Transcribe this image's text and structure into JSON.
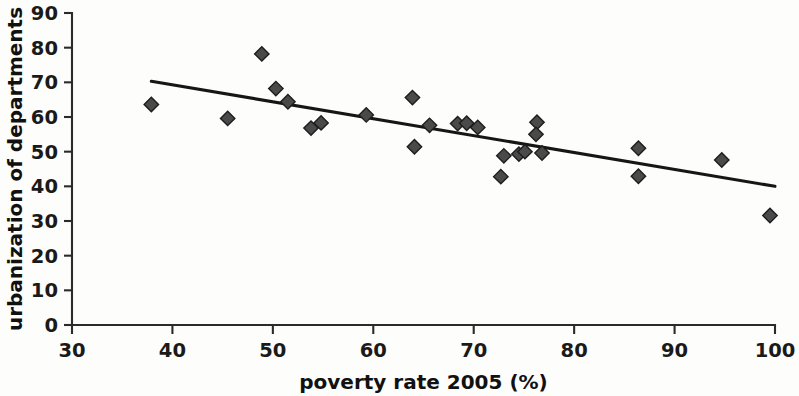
{
  "chart_data": {
    "type": "scatter",
    "title": "",
    "xlabel": "poverty rate 2005 (%)",
    "ylabel": "urbanization of departments",
    "xlim": [
      30,
      100
    ],
    "ylim": [
      0,
      90
    ],
    "xticks": [
      30,
      40,
      50,
      60,
      70,
      80,
      90,
      100
    ],
    "yticks": [
      0,
      10,
      20,
      30,
      40,
      50,
      60,
      70,
      80,
      90
    ],
    "xtick_labels": [
      "30",
      "40",
      "50",
      "60",
      "70",
      "80",
      "90",
      "100"
    ],
    "ytick_labels": [
      "0",
      "10",
      "20",
      "30",
      "40",
      "50",
      "60",
      "70",
      "80",
      "90"
    ],
    "grid": false,
    "legend": null,
    "marker": "diamond",
    "points": [
      {
        "x": 37.9,
        "y": 63.6
      },
      {
        "x": 45.5,
        "y": 59.6
      },
      {
        "x": 48.9,
        "y": 78.2
      },
      {
        "x": 50.3,
        "y": 68.2
      },
      {
        "x": 51.5,
        "y": 64.4
      },
      {
        "x": 53.8,
        "y": 56.8
      },
      {
        "x": 54.8,
        "y": 58.3
      },
      {
        "x": 59.3,
        "y": 60.6
      },
      {
        "x": 63.9,
        "y": 65.6
      },
      {
        "x": 64.1,
        "y": 51.4
      },
      {
        "x": 65.6,
        "y": 57.6
      },
      {
        "x": 68.4,
        "y": 58.1
      },
      {
        "x": 69.3,
        "y": 58.2
      },
      {
        "x": 70.4,
        "y": 57.0
      },
      {
        "x": 72.7,
        "y": 42.8
      },
      {
        "x": 73.0,
        "y": 48.8
      },
      {
        "x": 74.5,
        "y": 49.3
      },
      {
        "x": 75.1,
        "y": 50.0
      },
      {
        "x": 76.3,
        "y": 58.5
      },
      {
        "x": 76.2,
        "y": 55.0
      },
      {
        "x": 76.8,
        "y": 49.6
      },
      {
        "x": 86.4,
        "y": 51.0
      },
      {
        "x": 86.4,
        "y": 42.9
      },
      {
        "x": 94.7,
        "y": 47.6
      },
      {
        "x": 99.5,
        "y": 31.6
      }
    ],
    "trendline": {
      "type": "linear-fit",
      "x_start": 37.9,
      "y_start": 70.3,
      "x_end": 100.0,
      "y_end": 40.0
    }
  },
  "colors": {
    "background": "#fdfdfb",
    "axis": "#2b2b2b",
    "marker_fill": "#4a4a4a",
    "marker_stroke": "#1d1d1d",
    "trendline": "#161616",
    "text": "#111111"
  }
}
